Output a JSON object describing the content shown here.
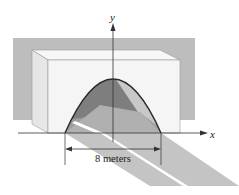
{
  "figure": {
    "type": "diagram",
    "axes": {
      "x_label": "x",
      "y_label": "y"
    },
    "dimension": {
      "label": "8 meters",
      "value": 8,
      "unit": "meters"
    },
    "colors": {
      "background_wall": "#b9b9b9",
      "box_face": "#f4f4f4",
      "box_side": "#e4e4e4",
      "arch_dark": "#7c7c7c",
      "arch_mid": "#9a9a9a",
      "arch_light": "#c4c4c4",
      "road": "#c2c2c2",
      "stripe": "#ffffff",
      "outline": "#2a2a2a"
    }
  }
}
